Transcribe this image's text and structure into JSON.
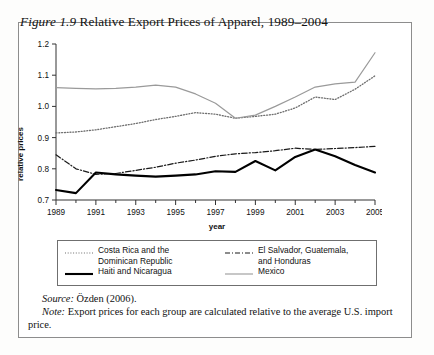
{
  "figure": {
    "number": "Figure 1.9",
    "title": "Relative Export Prices of Apparel, 1989–2004"
  },
  "source": {
    "lead": "Source:",
    "text": " Özden (2006)."
  },
  "note": {
    "lead": "Note:",
    "text": " Export prices for each group are calculated relative to the average U.S. import price."
  },
  "legend": {
    "items": [
      {
        "label": "Costa Rica and the\nDominican Republic",
        "style": "dotted",
        "color": "#6e6e6e",
        "name": "costa-rica-dominican-republic"
      },
      {
        "label": "El Salvador, Guatemala,\nand Honduras",
        "style": "dashdot",
        "color": "#1a1a1a",
        "name": "el-salvador-guatemala-honduras"
      },
      {
        "label": "Haiti and Nicaragua",
        "style": "solid-bold",
        "color": "#000000",
        "name": "haiti-nicaragua"
      },
      {
        "label": "Mexico",
        "style": "solid-thin",
        "color": "#9a9a9a",
        "name": "mexico"
      }
    ]
  },
  "chart_data": {
    "type": "line",
    "title": "Relative Export Prices of Apparel, 1989–2004",
    "xlabel": "year",
    "ylabel": "relative prices",
    "xlim": [
      1989,
      2005
    ],
    "ylim": [
      0.7,
      1.2
    ],
    "ytick_labels": [
      "0.7",
      "0.8",
      "0.9",
      "1.0",
      "1.1",
      "1.2"
    ],
    "yticks": [
      0.7,
      0.8,
      0.9,
      1.0,
      1.1,
      1.2
    ],
    "xtick_labels": [
      "1989",
      "1991",
      "1993",
      "1995",
      "1997",
      "1999",
      "2001",
      "2003",
      "2005"
    ],
    "xticks": [
      1989,
      1991,
      1993,
      1995,
      1997,
      1999,
      2001,
      2003,
      2005
    ],
    "x_minor_ticks": [
      1990,
      1992,
      1994,
      1996,
      1998,
      2000,
      2002,
      2004
    ],
    "grid": false,
    "legend_position": "below",
    "x": [
      1989,
      1990,
      1991,
      1992,
      1993,
      1994,
      1995,
      1996,
      1997,
      1998,
      1999,
      2000,
      2001,
      2002,
      2003,
      2004,
      2005
    ],
    "series": [
      {
        "name": "Costa Rica and the Dominican Republic",
        "style": "dotted",
        "color": "#6e6e6e",
        "values": [
          0.915,
          0.918,
          0.925,
          0.935,
          0.945,
          0.958,
          0.968,
          0.98,
          0.975,
          0.962,
          0.968,
          0.975,
          0.995,
          1.03,
          1.022,
          1.055,
          1.098
        ]
      },
      {
        "name": "El Salvador, Guatemala, and Honduras",
        "style": "dashdot",
        "color": "#1a1a1a",
        "values": [
          0.845,
          0.8,
          0.782,
          0.785,
          0.795,
          0.805,
          0.818,
          0.828,
          0.84,
          0.848,
          0.852,
          0.858,
          0.866,
          0.862,
          0.865,
          0.868,
          0.872
        ]
      },
      {
        "name": "Haiti and Nicaragua",
        "style": "solid-bold",
        "color": "#000000",
        "values": [
          0.732,
          0.722,
          0.788,
          0.782,
          0.778,
          0.775,
          0.778,
          0.782,
          0.792,
          0.79,
          0.825,
          0.795,
          0.838,
          0.862,
          0.84,
          0.812,
          0.788
        ]
      },
      {
        "name": "Mexico",
        "style": "solid-thin",
        "color": "#9a9a9a",
        "values": [
          1.06,
          1.058,
          1.056,
          1.058,
          1.062,
          1.068,
          1.062,
          1.04,
          1.01,
          0.962,
          0.972,
          1.0,
          1.03,
          1.062,
          1.072,
          1.078,
          1.172
        ]
      }
    ]
  }
}
